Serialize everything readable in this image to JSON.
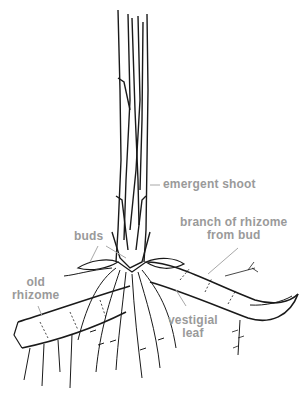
{
  "diagram": {
    "labels": {
      "emergent_shoot": "emergent shoot",
      "branch_line1": "branch of rhizome",
      "branch_line2": "from bud",
      "buds": "buds",
      "old_line1": "old",
      "old_line2": "rhizome",
      "vestigial_line1": "vestigial",
      "vestigial_line2": "leaf"
    },
    "colors": {
      "ink": "#1a1a1a",
      "label": "#9a9a9a",
      "leader": "#a8a8a8",
      "background": "#ffffff"
    }
  }
}
